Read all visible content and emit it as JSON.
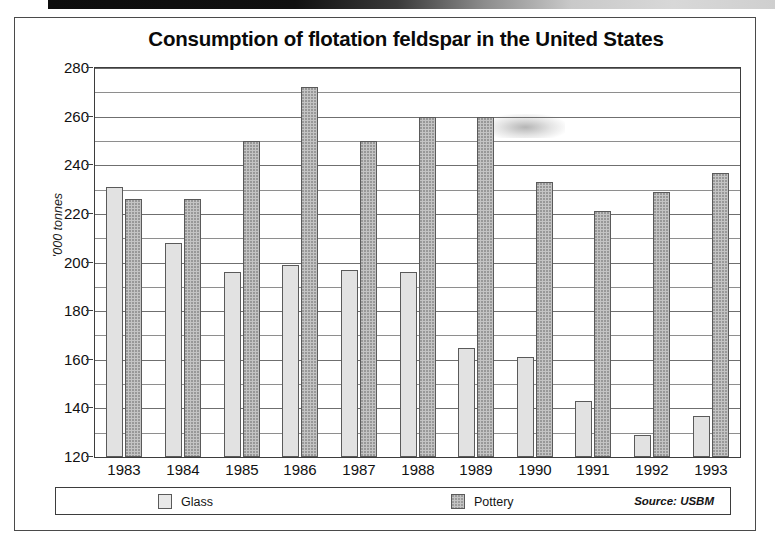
{
  "figure": {
    "title": "Consumption of flotation feldspar in the United States",
    "source_note": "Source: USBM"
  },
  "axes": {
    "y_axis_title": "'000 tonnes",
    "y_ticks": [
      "280",
      "260",
      "240",
      "220",
      "200",
      "180",
      "160",
      "140",
      "120"
    ],
    "x_ticks": [
      "1983",
      "1984",
      "1985",
      "1986",
      "1987",
      "1988",
      "1989",
      "1990",
      "1991",
      "1992",
      "1993"
    ]
  },
  "legend": {
    "items": [
      {
        "label": "Glass",
        "color": "#e2e2e2"
      },
      {
        "label": "Pottery",
        "color": "#c4c4c4"
      }
    ]
  },
  "chart_data": {
    "type": "bar",
    "title": "Consumption of flotation feldspar in the United States",
    "subtitle": "",
    "xlabel": "",
    "ylabel": "'000 tonnes",
    "categories": [
      "1983",
      "1984",
      "1985",
      "1986",
      "1987",
      "1988",
      "1989",
      "1990",
      "1991",
      "1992",
      "1993"
    ],
    "series": [
      {
        "name": "Glass",
        "color": "#e2e2e2",
        "values": [
          231,
          208,
          196,
          199,
          197,
          196,
          165,
          161,
          143,
          129,
          137
        ]
      },
      {
        "name": "Pottery",
        "color": "#c4c4c4",
        "values": [
          226,
          226,
          250,
          272,
          250,
          260,
          260,
          233,
          221,
          229,
          237
        ]
      }
    ],
    "ylim": [
      120,
      280
    ],
    "ytick_step": 20,
    "gridline_step": 10,
    "grid": true,
    "legend_position": "bottom",
    "annotations": [
      "Source: USBM"
    ]
  }
}
